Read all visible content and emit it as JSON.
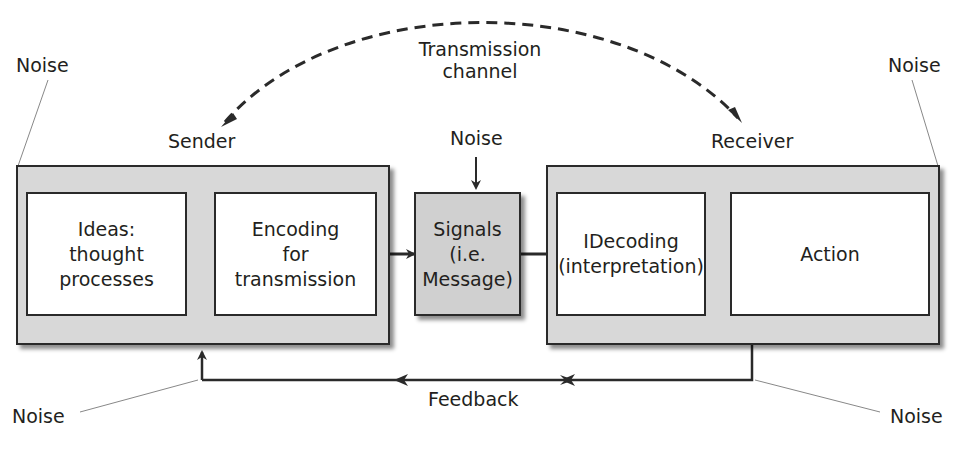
{
  "diagram": {
    "channel_label": [
      "Transmission",
      "channel"
    ],
    "sender": {
      "label": "Sender",
      "stages": [
        {
          "lines": [
            "Ideas:",
            "thought",
            "processes"
          ]
        },
        {
          "lines": [
            "Encoding",
            "for",
            "transmission"
          ]
        }
      ]
    },
    "signal": {
      "lines": [
        "Signals",
        "(i.e.",
        "Message)"
      ],
      "noise_label": "Noise"
    },
    "receiver": {
      "label": "Receiver",
      "stages": [
        {
          "lines": [
            "IDecoding",
            "(interpretation)"
          ]
        },
        {
          "lines": [
            "Action"
          ]
        }
      ]
    },
    "feedback_label": "Feedback",
    "noise_labels": {
      "top_left": "Noise",
      "top_right": "Noise",
      "bottom_left": "Noise",
      "bottom_right": "Noise"
    },
    "colors": {
      "container_fill": "#d8d8d8",
      "box_fill": "#ffffff",
      "signal_fill": "#d0d0d0",
      "line": "#2a2a2a",
      "leader_line": "#888888"
    }
  }
}
